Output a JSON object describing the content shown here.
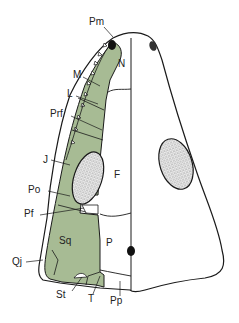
{
  "figure": {
    "colors": {
      "bone_fill": "#a7bb94",
      "outline": "#1a1a1a",
      "background": "#ffffff",
      "fenestra_stipple": "#d9d9d9"
    },
    "labels": {
      "Pm": "Pm",
      "M": "M",
      "L": "L",
      "Prf": "Prf",
      "J": "J",
      "Po": "Po",
      "Pf": "Pf",
      "Qj": "Qj",
      "St": "St",
      "T": "T",
      "Pp": "Pp",
      "N": "N",
      "F": "F",
      "Sq": "Sq",
      "P": "P"
    }
  }
}
